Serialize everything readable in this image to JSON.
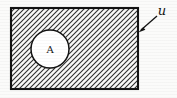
{
  "figure": {
    "caption_title": "Set diagram",
    "background_color": "#fbfbfa",
    "ink_color": "#111111",
    "hatch_color": "#2b2b2b",
    "width": 177,
    "height": 98
  },
  "universe": {
    "label": "ɵ",
    "label_display": "u",
    "name": "universal-set",
    "shape": "rectangle",
    "fill_style": "diagonal-hatch",
    "hatch_direction": "bottom-left-to-top-right",
    "hatch_spacing_px": 5,
    "bounds": {
      "x": 11,
      "y": 8,
      "width": 127,
      "height": 81
    },
    "label_position": {
      "x": 162,
      "y": 11
    }
  },
  "set_a": {
    "label": "A",
    "name": "set-a",
    "shape": "circle",
    "fill_style": "solid-white",
    "center": {
      "x": 50,
      "y": 49
    },
    "radius": 19
  },
  "leader": {
    "name": "leader-arrow",
    "from": {
      "x": 157,
      "y": 17
    },
    "to": {
      "x": 139,
      "y": 32
    },
    "arrowhead_at": "to"
  }
}
